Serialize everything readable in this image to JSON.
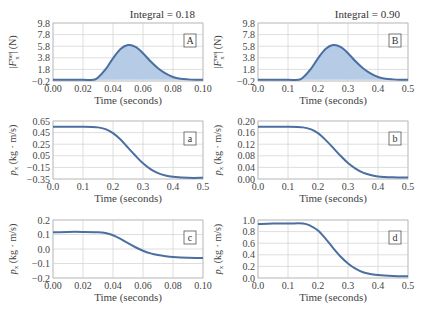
{
  "colors": {
    "line": "#4a6fa0",
    "fill": "#b6cbe6",
    "grid": "#d6d6d6",
    "frame": "#bbbbbb"
  },
  "chart_data": [
    {
      "id": "A",
      "type": "area",
      "tag": "A",
      "title": "Integral = 0.18",
      "xlabel": "Time (seconds)",
      "ylabel": "|F_x^net| (N)",
      "xlim": [
        0,
        0.1
      ],
      "ylim": [
        -0.2,
        9.8
      ],
      "xticks": [
        "0.00",
        "0.02",
        "0.04",
        "0.06",
        "0.08",
        "0.10"
      ],
      "yticks": [
        "9.8",
        "7.8",
        "5.8",
        "3.8",
        "1.8",
        "−0.2"
      ],
      "x": [
        0,
        0.01,
        0.02,
        0.027,
        0.03,
        0.035,
        0.04,
        0.045,
        0.05,
        0.055,
        0.06,
        0.065,
        0.07,
        0.075,
        0.08,
        0.085,
        0.09,
        0.095,
        0.1
      ],
      "y": [
        0,
        0,
        0,
        0,
        0.4,
        1.8,
        3.7,
        5.3,
        6.0,
        5.7,
        4.6,
        3.2,
        2.0,
        1.1,
        0.5,
        0.2,
        0.08,
        0.02,
        0
      ]
    },
    {
      "id": "B",
      "type": "area",
      "tag": "B",
      "title": "Integral = 0.90",
      "xlabel": "Time (seconds)",
      "ylabel": "|F_x^net| (N)",
      "xlim": [
        0,
        0.5
      ],
      "ylim": [
        -0.2,
        9.8
      ],
      "xticks": [
        "0.0",
        "0.1",
        "0.2",
        "0.3",
        "0.4",
        "0.5"
      ],
      "yticks": [
        "9.8",
        "7.8",
        "5.8",
        "3.8",
        "1.8",
        "−0.2"
      ],
      "x": [
        0,
        0.05,
        0.1,
        0.135,
        0.15,
        0.175,
        0.2,
        0.225,
        0.25,
        0.275,
        0.3,
        0.325,
        0.35,
        0.375,
        0.4,
        0.425,
        0.45,
        0.475,
        0.5
      ],
      "y": [
        0,
        0,
        0,
        0,
        0.4,
        1.8,
        3.7,
        5.3,
        6.0,
        5.7,
        4.6,
        3.2,
        2.0,
        1.1,
        0.5,
        0.2,
        0.08,
        0.02,
        0
      ]
    },
    {
      "id": "a",
      "type": "line",
      "tag": "a",
      "xlabel": "Time (seconds)",
      "ylabel": "p_x (kg · m/s)",
      "xlim": [
        0,
        0.5
      ],
      "ylim": [
        -0.35,
        0.65
      ],
      "xticks": [
        "0.0",
        "0.1",
        "0.2",
        "0.3",
        "0.4",
        "0.5"
      ],
      "yticks": [
        "0.65",
        "0.45",
        "0.25",
        "0.05",
        "−0.15",
        "−0.35"
      ],
      "x": [
        0,
        0.05,
        0.1,
        0.15,
        0.175,
        0.2,
        0.225,
        0.25,
        0.275,
        0.3,
        0.325,
        0.35,
        0.375,
        0.4,
        0.45,
        0.5
      ],
      "y": [
        0.55,
        0.55,
        0.55,
        0.54,
        0.51,
        0.44,
        0.33,
        0.19,
        0.05,
        -0.08,
        -0.18,
        -0.25,
        -0.29,
        -0.31,
        -0.33,
        -0.33
      ]
    },
    {
      "id": "b",
      "type": "line",
      "tag": "b",
      "xlabel": "Time (seconds)",
      "ylabel": "p_x (kg · m/s)",
      "xlim": [
        0,
        0.5
      ],
      "ylim": [
        0,
        0.2
      ],
      "xticks": [
        "0.0",
        "0.1",
        "0.2",
        "0.3",
        "0.4",
        "0.5"
      ],
      "yticks": [
        "0.20",
        "0.16",
        "0.12",
        "0.08",
        "0.04",
        "0.00"
      ],
      "x": [
        0,
        0.05,
        0.1,
        0.15,
        0.175,
        0.2,
        0.225,
        0.25,
        0.275,
        0.3,
        0.325,
        0.35,
        0.375,
        0.4,
        0.45,
        0.5
      ],
      "y": [
        0.18,
        0.18,
        0.18,
        0.178,
        0.172,
        0.158,
        0.135,
        0.108,
        0.08,
        0.055,
        0.036,
        0.022,
        0.014,
        0.009,
        0.006,
        0.005
      ]
    },
    {
      "id": "c",
      "type": "line",
      "tag": "c",
      "xlabel": "Time (seconds)",
      "ylabel": "p_x (kg · m/s)",
      "xlim": [
        0,
        0.1
      ],
      "ylim": [
        -0.2,
        0.2
      ],
      "xticks": [
        "0.00",
        "0.02",
        "0.04",
        "0.06",
        "0.08",
        "0.10"
      ],
      "yticks": [
        "0.2",
        "0.1",
        "0.0",
        "−0.1",
        "−0.2"
      ],
      "x": [
        0,
        0.01,
        0.02,
        0.03,
        0.035,
        0.04,
        0.045,
        0.05,
        0.055,
        0.06,
        0.065,
        0.07,
        0.075,
        0.08,
        0.09,
        0.1
      ],
      "y": [
        0.115,
        0.118,
        0.118,
        0.116,
        0.11,
        0.095,
        0.07,
        0.04,
        0.012,
        -0.012,
        -0.03,
        -0.042,
        -0.05,
        -0.055,
        -0.06,
        -0.062
      ]
    },
    {
      "id": "d",
      "type": "line",
      "tag": "d",
      "xlabel": "Time (seconds)",
      "ylabel": "p_x (kg · m/s)",
      "xlim": [
        0,
        0.5
      ],
      "ylim": [
        0,
        1.0
      ],
      "xticks": [
        "0.0",
        "0.1",
        "0.2",
        "0.3",
        "0.4",
        "0.5"
      ],
      "yticks": [
        "1.0",
        "0.8",
        "0.6",
        "0.4",
        "0.2",
        "0.0"
      ],
      "x": [
        0,
        0.05,
        0.1,
        0.15,
        0.175,
        0.2,
        0.225,
        0.25,
        0.275,
        0.3,
        0.325,
        0.35,
        0.375,
        0.4,
        0.45,
        0.5
      ],
      "y": [
        0.93,
        0.94,
        0.94,
        0.94,
        0.9,
        0.82,
        0.68,
        0.52,
        0.37,
        0.25,
        0.16,
        0.1,
        0.07,
        0.05,
        0.035,
        0.03
      ]
    }
  ],
  "layout": [
    {
      "left": 53,
      "top": 23,
      "w": 150,
      "h": 58
    },
    {
      "left": 258,
      "top": 23,
      "w": 150,
      "h": 58
    },
    {
      "left": 53,
      "top": 121,
      "w": 150,
      "h": 58
    },
    {
      "left": 258,
      "top": 121,
      "w": 150,
      "h": 58
    },
    {
      "left": 53,
      "top": 220,
      "w": 150,
      "h": 58
    },
    {
      "left": 258,
      "top": 220,
      "w": 150,
      "h": 58
    }
  ]
}
